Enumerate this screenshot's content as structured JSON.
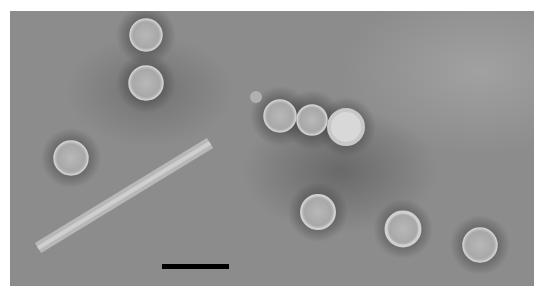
{
  "image": {
    "description": "Negative-stain electron micrograph showing spherical virus-like particles and one elongated rod-shaped particle on a gray background with a black scale bar",
    "scale_bar": {
      "label": ""
    }
  },
  "colors": {
    "background": "#8c8c8c",
    "particle": "#b4b4b4",
    "scale_bar": "#000000",
    "border": "#ffffff"
  }
}
